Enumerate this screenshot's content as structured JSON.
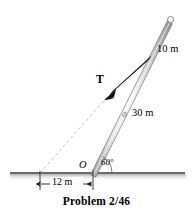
{
  "figure": {
    "caption": "Problem 2/46",
    "labels": {
      "upper_segment": "10 m",
      "lower_segment": "30 m",
      "tension": "T",
      "origin": "O",
      "angle": "60°",
      "ground_distance": "12 m"
    },
    "colors": {
      "pole_fill": "#d8d8d8",
      "pole_highlight": "#f4f4f4",
      "pole_edge": "#6e6e6e",
      "ground": "#3a3a3a",
      "dashed": "#b9b9b9",
      "arrow": "#111111",
      "text": "#000000"
    },
    "geometry": {
      "pole_base": [
        93,
        173
      ],
      "pole_top": [
        170,
        20
      ],
      "cable_anchor": [
        150,
        57
      ],
      "cable_ground_point": [
        40,
        173
      ],
      "angle_degrees": 60,
      "pole_total_length_m": 40,
      "upper_length_m": 10,
      "lower_length_m": 30,
      "ground_distance_m": 12
    }
  }
}
